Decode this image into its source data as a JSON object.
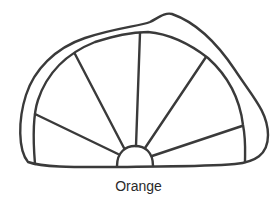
{
  "figure": {
    "caption": "Orange",
    "stroke_color": "#3a3a3a"
  }
}
